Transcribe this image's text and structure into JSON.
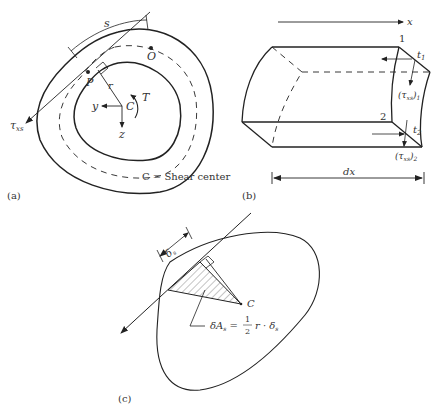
{
  "panel_a": {
    "tag": "(a)",
    "labels": {
      "s": "s",
      "O": "O",
      "P": "P",
      "r": "r",
      "C": "C",
      "T": "T",
      "y": "y",
      "z": "z",
      "tau": "τ",
      "tau_sub": "xs"
    },
    "caption": "C = Shear center"
  },
  "panel_b": {
    "tag": "(b)",
    "labels": {
      "x": "x",
      "one": "1",
      "two": "2",
      "t1": "t",
      "t1_sub": "1",
      "t2": "t",
      "t2_sub": "2",
      "tau1": "(τ",
      "tau1_sub": "xs",
      "tau1_close": ")",
      "tau1_sub2": "1",
      "tau2": "(τ",
      "tau2_sub": "xs",
      "tau2_close": ")",
      "tau2_sub2": "2",
      "dx": "dx"
    }
  },
  "panel_c": {
    "tag": "(c)",
    "labels": {
      "delta_s": "δ",
      "delta_s_sub": "s",
      "C": "C",
      "formula_lhs": "δA",
      "formula_lhs_sub": "s",
      "formula_eq": " = ",
      "formula_num": "1",
      "formula_den": "2",
      "formula_rhs": "r · δ",
      "formula_rhs_sub": "s"
    }
  }
}
